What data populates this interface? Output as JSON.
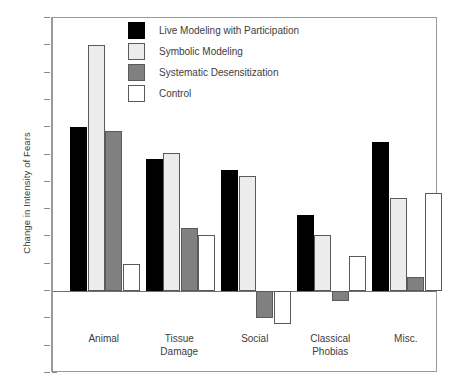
{
  "chart_data": {
    "type": "bar",
    "title": "",
    "subtitle": "",
    "xlabel": "",
    "ylabel": "Change in Intensity of Fears",
    "categories": [
      "Animal",
      "Tissue\nDamage",
      "Social",
      "Classical\nPhobias",
      "Misc."
    ],
    "category_lines": [
      [
        "Animal"
      ],
      [
        "Tissue",
        "Damage"
      ],
      [
        "Social"
      ],
      [
        "Classical",
        "Phobias"
      ],
      [
        "Misc."
      ]
    ],
    "ylim": [
      -10,
      3
    ],
    "y_inverted": true,
    "yticks": [
      -10,
      -9,
      -8,
      -7,
      -6,
      -5,
      -4,
      -3,
      -2,
      -1,
      0,
      1,
      2,
      3
    ],
    "ytick_labels": [
      "−10",
      "−9",
      "−8",
      "−7",
      "−6",
      "−5",
      "−4",
      "−3",
      "−2",
      "−1",
      "0",
      "1",
      "2",
      "3"
    ],
    "grid": false,
    "legend_position": "top-center",
    "zero_reference": 0,
    "series": [
      {
        "name": "Live Modeling with Participation",
        "color": "#000000",
        "edge_color": "#4f4f4f",
        "values": [
          -6.0,
          -4.85,
          -4.45,
          -2.8,
          -5.45
        ]
      },
      {
        "name": "Symbolic Modeling",
        "color": "#ececec",
        "edge_color": "#5a5a5a",
        "values": [
          -9.0,
          -5.05,
          -4.2,
          -2.05,
          -3.4
        ]
      },
      {
        "name": "Systematic Desensitization",
        "color": "#808080",
        "edge_color": "#5a5a5a",
        "values": [
          -5.85,
          -2.3,
          1.0,
          0.35,
          -0.5
        ]
      },
      {
        "name": "Control",
        "color": "#ffffff",
        "edge_color": "#5a5a5a",
        "values": [
          -1.0,
          -2.05,
          1.2,
          -1.3,
          -3.6
        ]
      }
    ]
  },
  "legend": {
    "items": [
      {
        "label": "Live Modeling with Participation",
        "color": "#000000"
      },
      {
        "label": "Symbolic Modeling",
        "color": "#ececec"
      },
      {
        "label": "Systematic Desensitization",
        "color": "#808080"
      },
      {
        "label": "Control",
        "color": "#ffffff"
      }
    ]
  },
  "axes": {
    "y_title": "Change in Intensity of Fears"
  }
}
